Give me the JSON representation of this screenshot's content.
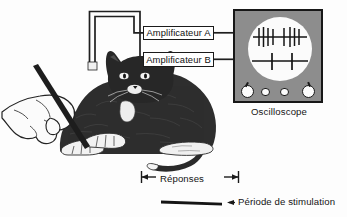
{
  "figure": {
    "background_color": "#fdfdfd",
    "ink_color": "#1a1a1a"
  },
  "amplifiers": {
    "a": {
      "label": "Amplificateur A"
    },
    "b": {
      "label": "Amplificateur B"
    }
  },
  "oscilloscope": {
    "caption": "Oscilloscope",
    "body_color": "#8d8d8d",
    "screen_color": "#fbfbfb",
    "knobs": [
      {
        "name": "knob-large-left",
        "size": "big"
      },
      {
        "name": "knob-small-left",
        "size": "small"
      },
      {
        "name": "knob-small-right",
        "size": "small"
      },
      {
        "name": "knob-large-right",
        "size": "big"
      }
    ],
    "traces": [
      {
        "name": "trace-a",
        "channel": "A",
        "spike_count": 8,
        "description": "salve de potentiels d'action dense"
      },
      {
        "name": "trace-b",
        "channel": "B",
        "spike_count": 2,
        "description": "deux potentiels d'action espacés"
      }
    ]
  },
  "annotations": {
    "responses": {
      "label": "Réponses"
    },
    "stimulation": {
      "label": "Période de stimulation"
    }
  },
  "subject": {
    "animal": "chat",
    "stimulus_tool": "baguette",
    "electrodes": 2
  }
}
